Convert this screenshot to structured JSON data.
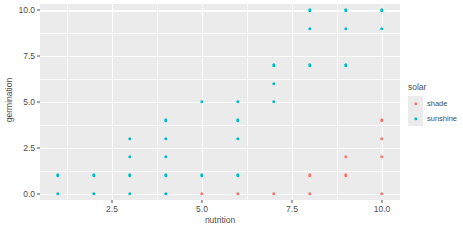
{
  "chart_data": {
    "type": "scatter",
    "title": "",
    "xlabel": "nutrition",
    "ylabel": "germination",
    "xlim": [
      0.5,
      10.5
    ],
    "ylim": [
      -0.35,
      10.35
    ],
    "xticks": [
      "2.5",
      "5.0",
      "7.5",
      "10.0"
    ],
    "xtick_values": [
      2.5,
      5.0,
      7.5,
      10.0
    ],
    "yticks": [
      "0.0",
      "2.5",
      "5.0",
      "7.5",
      "10.0"
    ],
    "ytick_values": [
      0.0,
      2.5,
      5.0,
      7.5,
      10.0
    ],
    "grid": true,
    "legend": {
      "title": "solar",
      "position": "right",
      "entries": [
        {
          "label": "shade",
          "color": "#f8766d"
        },
        {
          "label": "sunshine",
          "color": "#00bfc4"
        }
      ]
    },
    "series": [
      {
        "name": "sunshine",
        "color": "#00bfc4",
        "points": [
          [
            1,
            0
          ],
          [
            2,
            0
          ],
          [
            3,
            0
          ],
          [
            4,
            0
          ],
          [
            1,
            1
          ],
          [
            2,
            1
          ],
          [
            3,
            1
          ],
          [
            4,
            1
          ],
          [
            5,
            1
          ],
          [
            6,
            1
          ],
          [
            3,
            2
          ],
          [
            4,
            2
          ],
          [
            3,
            3
          ],
          [
            4,
            3
          ],
          [
            6,
            3
          ],
          [
            4,
            4
          ],
          [
            6,
            4
          ],
          [
            5,
            5
          ],
          [
            6,
            5
          ],
          [
            7,
            5
          ],
          [
            7,
            6
          ],
          [
            7,
            7
          ],
          [
            8,
            7
          ],
          [
            9,
            7
          ],
          [
            8,
            9
          ],
          [
            9,
            9
          ],
          [
            10,
            9
          ],
          [
            8,
            10
          ],
          [
            9,
            10
          ],
          [
            10,
            10
          ]
        ]
      },
      {
        "name": "shade",
        "color": "#f8766d",
        "points": [
          [
            5,
            0
          ],
          [
            6,
            0
          ],
          [
            7,
            0
          ],
          [
            8,
            0
          ],
          [
            10,
            0
          ],
          [
            8,
            1
          ],
          [
            9,
            1
          ],
          [
            9,
            2
          ],
          [
            10,
            2
          ],
          [
            10,
            3
          ],
          [
            10,
            4
          ]
        ]
      }
    ]
  }
}
